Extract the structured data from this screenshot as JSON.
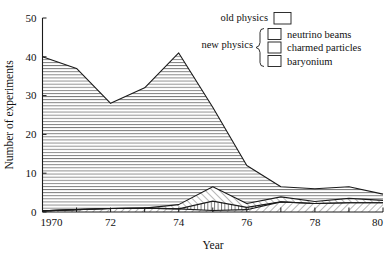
{
  "chart_data": {
    "type": "area",
    "title": "",
    "xlabel": "Year",
    "ylabel": "Number of experiments",
    "xlim": [
      1970,
      1980
    ],
    "ylim": [
      0,
      50
    ],
    "ytick_values": [
      0,
      10,
      20,
      30,
      40,
      50
    ],
    "ytick_labels": [
      "0",
      "10",
      "20",
      "30",
      "40",
      "50"
    ],
    "xtick_values": [
      1970,
      1971,
      1972,
      1973,
      1974,
      1975,
      1976,
      1977,
      1978,
      1979,
      1980
    ],
    "xtick_labels": [
      "1970",
      "",
      "72",
      "",
      "74",
      "",
      "76",
      "",
      "78",
      "",
      "80"
    ],
    "grid": false,
    "stacked": true,
    "legend_position": "top-right",
    "x": [
      1970,
      1971,
      1972,
      1973,
      1974,
      1975,
      1976,
      1977,
      1978,
      1979,
      1980
    ],
    "series": [
      {
        "name": "baryonium",
        "hatch": "backslash-diagonal",
        "values": [
          0.3,
          0.6,
          0.9,
          1.0,
          0.8,
          0.4,
          0.6,
          2.6,
          2.2,
          2.4,
          2.4
        ]
      },
      {
        "name": "charmed particles",
        "hatch": "vertical",
        "values": [
          0,
          0,
          0,
          0,
          0,
          2.4,
          0.6,
          0,
          0,
          0,
          0
        ]
      },
      {
        "name": "neutrino beams",
        "hatch": "forward-diagonal",
        "values": [
          0,
          0,
          0,
          0,
          1.1,
          3.7,
          1.0,
          1.3,
          0.5,
          1.1,
          0.6
        ]
      },
      {
        "name": "old physics",
        "hatch": "horizontal",
        "values": [
          39.7,
          36.4,
          27.1,
          31.0,
          39.1,
          20.5,
          9.8,
          2.6,
          3.3,
          3.0,
          1.6
        ]
      }
    ],
    "cumulative_totals": [
      40,
      37,
      28,
      32,
      41,
      27,
      12,
      6.5,
      6,
      6.5,
      4.6
    ],
    "annotations": []
  },
  "legend": {
    "group_old_label": "old physics",
    "group_new_label": "new physics",
    "items": [
      {
        "label": "neutrino beams",
        "swatch": "forward-diagonal-swatch"
      },
      {
        "label": "charmed particles",
        "swatch": "vertical-swatch"
      },
      {
        "label": "baryonium",
        "swatch": "backslash-diagonal-swatch"
      }
    ]
  },
  "colors": {
    "ink": "#1a1a1a",
    "background": "#ffffff",
    "hatch": "#555555"
  }
}
